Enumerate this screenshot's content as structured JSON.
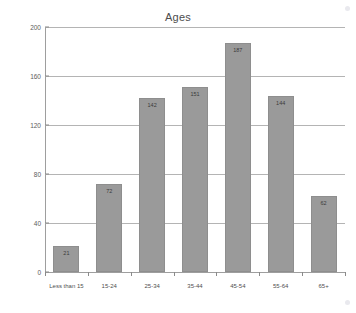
{
  "chart_data": {
    "type": "bar",
    "title": "Ages",
    "xlabel": "",
    "ylabel": "",
    "categories": [
      "Less than 15",
      "15-24",
      "25-34",
      "35-44",
      "45-54",
      "55-64",
      "65+"
    ],
    "values": [
      21,
      72,
      142,
      151,
      187,
      144,
      62
    ],
    "value_labels": [
      "21",
      "72",
      "142",
      "151",
      "187",
      "144",
      "62"
    ],
    "ylim": [
      0,
      200
    ],
    "yticks": [
      0,
      40,
      80,
      120,
      160,
      200
    ],
    "ytick_labels": [
      "0",
      "40",
      "80",
      "120",
      "160",
      "200"
    ],
    "grid": true,
    "grid_axis": "y",
    "legend": false,
    "bar_color": "#9a9a9a",
    "bar_border_color": "#8e8e8e",
    "grid_color": "#b4b4b4",
    "axis_color": "#9e9e9e",
    "text_color": "#4d4d4d",
    "background": "#ffffff"
  }
}
